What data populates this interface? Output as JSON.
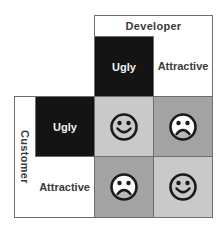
{
  "diagram": {
    "column_group_label": "Developer",
    "row_group_label": "Customer",
    "columns": [
      {
        "label": "Ugly",
        "fill": "#141414",
        "text_color": "#f2f2f2"
      },
      {
        "label": "Attractive",
        "fill": "#ffffff",
        "text_color": "#3a3a3a"
      }
    ],
    "rows": [
      {
        "label": "Ugly",
        "fill": "#141414",
        "text_color": "#f2f2f2"
      },
      {
        "label": "Attractive",
        "fill": "#ffffff",
        "text_color": "#3a3a3a"
      }
    ],
    "cells": [
      {
        "row": "Ugly",
        "column": "Ugly",
        "icon": "happy-face-icon",
        "fill": "#c9c9c9"
      },
      {
        "row": "Ugly",
        "column": "Attractive",
        "icon": "sad-face-icon",
        "fill": "#a3a3a3"
      },
      {
        "row": "Attractive",
        "column": "Ugly",
        "icon": "sad-face-icon",
        "fill": "#a3a3a3"
      },
      {
        "row": "Attractive",
        "column": "Attractive",
        "icon": "happy-face-icon",
        "fill": "#c9c9c9"
      }
    ]
  }
}
